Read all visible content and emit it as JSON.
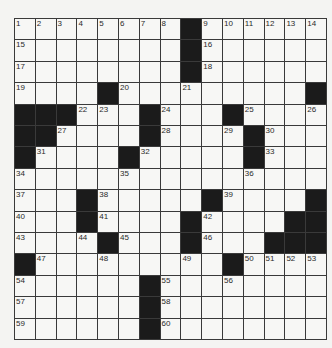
{
  "puzzle": {
    "type": "crossword",
    "rows": 15,
    "cols": 15,
    "grid": [
      [
        "1",
        "2",
        "3",
        "4",
        "5",
        "6",
        "7",
        "8",
        "#",
        "9",
        "10",
        "11",
        "12",
        "13",
        "14"
      ],
      [
        "15",
        "",
        "",
        "",
        "",
        "",
        "",
        "",
        "#",
        "16",
        "",
        "",
        "",
        "",
        ""
      ],
      [
        "17",
        "",
        "",
        "",
        "",
        "",
        "",
        "",
        "#",
        "18",
        "",
        "",
        "",
        "",
        ""
      ],
      [
        "19",
        "",
        "",
        "",
        "#",
        "20",
        "",
        "",
        "21",
        "",
        "",
        "",
        "",
        "",
        "#"
      ],
      [
        "#",
        "#",
        "#",
        "22",
        "23",
        "",
        "#",
        "24",
        "",
        "",
        "#",
        "25",
        "",
        "",
        "26"
      ],
      [
        "#",
        "#",
        "27",
        "",
        "",
        "",
        "#",
        "28",
        "",
        "",
        "29",
        "#",
        "30",
        "",
        ""
      ],
      [
        "#",
        "31",
        "",
        "",
        "",
        "#",
        "32",
        "",
        "",
        "",
        "",
        "#",
        "33",
        "",
        ""
      ],
      [
        "34",
        "",
        "",
        "",
        "",
        "35",
        "",
        "",
        "",
        "",
        "",
        "36",
        "",
        "",
        ""
      ],
      [
        "37",
        "",
        "",
        "#",
        "38",
        "",
        "",
        "",
        "",
        "#",
        "39",
        "",
        "",
        "",
        "#"
      ],
      [
        "40",
        "",
        "",
        "#",
        "41",
        "",
        "",
        "",
        "#",
        "42",
        "",
        "",
        "",
        "#",
        "#"
      ],
      [
        "43",
        "",
        "",
        "44",
        "#",
        "45",
        "",
        "",
        "#",
        "46",
        "",
        "",
        "#",
        "#",
        "#"
      ],
      [
        "#",
        "47",
        "",
        "",
        "48",
        "",
        "",
        "",
        "49",
        "",
        "#",
        "50",
        "51",
        "52",
        "53"
      ],
      [
        "54",
        "",
        "",
        "",
        "",
        "",
        "#",
        "55",
        "",
        "",
        "56",
        "",
        "",
        "",
        ""
      ],
      [
        "57",
        "",
        "",
        "",
        "",
        "",
        "#",
        "58",
        "",
        "",
        "",
        "",
        "",
        "",
        ""
      ],
      [
        "59",
        "",
        "",
        "",
        "",
        "",
        "#",
        "60",
        "",
        "",
        "",
        "",
        "",
        "",
        ""
      ]
    ],
    "colors": {
      "black_square": "#1b1b1b",
      "white_square": "#f7f7f5",
      "grid_line": "#3a3a3a"
    }
  }
}
